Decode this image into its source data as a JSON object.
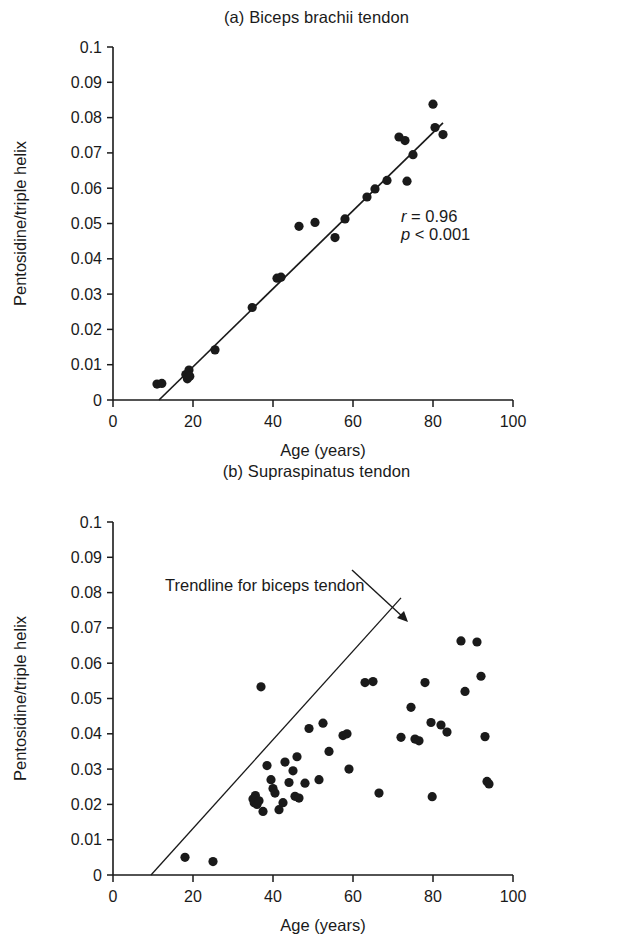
{
  "figure": {
    "x_axis_title": "Age (years)",
    "y_axis_title": "Pentosidine/triple helix"
  },
  "chart_data": [
    {
      "type": "scatter",
      "panel": "a",
      "title": "(a)  Biceps brachii tendon",
      "xlabel": "Age (years)",
      "ylabel": "Pentosidine/triple helix",
      "xlim": [
        0,
        100
      ],
      "ylim": [
        0,
        0.1
      ],
      "xticks": [
        0,
        20,
        40,
        60,
        80,
        100
      ],
      "xtick_labels": [
        "0",
        "20",
        "40",
        "60",
        "80",
        "100"
      ],
      "yticks": [
        0,
        0.01,
        0.02,
        0.03,
        0.04,
        0.05,
        0.06,
        0.07,
        0.08,
        0.09,
        0.1
      ],
      "ytick_labels": [
        "0",
        "0.01",
        "0.02",
        "0.03",
        "0.04",
        "0.05",
        "0.06",
        "0.07",
        "0.08",
        "0.09",
        "0.1"
      ],
      "grid": false,
      "legend": "none",
      "annotations": [
        {
          "text_italic": "r",
          "text_rest": " = 0.96",
          "x": 72,
          "y": 0.0505
        },
        {
          "text_italic": "p",
          "text_rest": " < 0.001",
          "x": 72,
          "y": 0.0452
        }
      ],
      "trendline": {
        "x": [
          11.5,
          82.5
        ],
        "y": [
          0.0,
          0.0785
        ]
      },
      "points": [
        {
          "x": 11.0,
          "y": 0.0045
        },
        {
          "x": 12.2,
          "y": 0.0047
        },
        {
          "x": 18.2,
          "y": 0.0072
        },
        {
          "x": 18.6,
          "y": 0.006
        },
        {
          "x": 19.0,
          "y": 0.0085
        },
        {
          "x": 19.2,
          "y": 0.0067
        },
        {
          "x": 25.5,
          "y": 0.0142
        },
        {
          "x": 34.8,
          "y": 0.0262
        },
        {
          "x": 41.0,
          "y": 0.0345
        },
        {
          "x": 42.0,
          "y": 0.0348
        },
        {
          "x": 46.5,
          "y": 0.0492
        },
        {
          "x": 50.5,
          "y": 0.0503
        },
        {
          "x": 55.5,
          "y": 0.046
        },
        {
          "x": 58.0,
          "y": 0.0513
        },
        {
          "x": 63.5,
          "y": 0.0575
        },
        {
          "x": 65.5,
          "y": 0.0598
        },
        {
          "x": 68.5,
          "y": 0.0622
        },
        {
          "x": 71.5,
          "y": 0.0745
        },
        {
          "x": 73.0,
          "y": 0.0735
        },
        {
          "x": 73.5,
          "y": 0.062
        },
        {
          "x": 75.0,
          "y": 0.0695
        },
        {
          "x": 80.0,
          "y": 0.0838
        },
        {
          "x": 80.5,
          "y": 0.0772
        },
        {
          "x": 82.5,
          "y": 0.0752
        }
      ]
    },
    {
      "type": "scatter",
      "panel": "b",
      "title": "(b)  Supraspinatus tendon",
      "xlabel": "Age (years)",
      "ylabel": "Pentosidine/triple helix",
      "xlim": [
        0,
        100
      ],
      "ylim": [
        0,
        0.1
      ],
      "xticks": [
        0,
        20,
        40,
        60,
        80,
        100
      ],
      "xtick_labels": [
        "0",
        "20",
        "40",
        "60",
        "80",
        "100"
      ],
      "yticks": [
        0,
        0.01,
        0.02,
        0.03,
        0.04,
        0.05,
        0.06,
        0.07,
        0.08,
        0.09,
        0.1
      ],
      "ytick_labels": [
        "0",
        "0.01",
        "0.02",
        "0.03",
        "0.04",
        "0.05",
        "0.06",
        "0.07",
        "0.08",
        "0.09",
        "0.1"
      ],
      "grid": false,
      "legend": "none",
      "annotations": [
        {
          "text": "Trendline for biceps tendon",
          "x": 13,
          "y": 0.0805
        }
      ],
      "trendline": {
        "x": [
          9.5,
          72.0
        ],
        "y": [
          0.0,
          0.0785
        ],
        "label": "Trendline for biceps tendon"
      },
      "points": [
        {
          "x": 18.0,
          "y": 0.005
        },
        {
          "x": 25.0,
          "y": 0.0038
        },
        {
          "x": 35.0,
          "y": 0.0215
        },
        {
          "x": 35.3,
          "y": 0.0205
        },
        {
          "x": 35.6,
          "y": 0.0225
        },
        {
          "x": 36.0,
          "y": 0.02
        },
        {
          "x": 36.5,
          "y": 0.021
        },
        {
          "x": 37.0,
          "y": 0.0533
        },
        {
          "x": 37.5,
          "y": 0.018
        },
        {
          "x": 38.5,
          "y": 0.031
        },
        {
          "x": 39.5,
          "y": 0.027
        },
        {
          "x": 40.0,
          "y": 0.0245
        },
        {
          "x": 40.5,
          "y": 0.0232
        },
        {
          "x": 41.5,
          "y": 0.0185
        },
        {
          "x": 42.5,
          "y": 0.0205
        },
        {
          "x": 43.0,
          "y": 0.032
        },
        {
          "x": 44.0,
          "y": 0.0262
        },
        {
          "x": 45.0,
          "y": 0.0295
        },
        {
          "x": 45.5,
          "y": 0.0223
        },
        {
          "x": 46.0,
          "y": 0.0335
        },
        {
          "x": 46.5,
          "y": 0.0218
        },
        {
          "x": 48.0,
          "y": 0.026
        },
        {
          "x": 49.0,
          "y": 0.0415
        },
        {
          "x": 51.5,
          "y": 0.027
        },
        {
          "x": 52.5,
          "y": 0.043
        },
        {
          "x": 54.0,
          "y": 0.035
        },
        {
          "x": 57.5,
          "y": 0.0395
        },
        {
          "x": 58.5,
          "y": 0.04
        },
        {
          "x": 59.0,
          "y": 0.03
        },
        {
          "x": 63.0,
          "y": 0.0545
        },
        {
          "x": 65.0,
          "y": 0.0548
        },
        {
          "x": 66.5,
          "y": 0.0232
        },
        {
          "x": 72.0,
          "y": 0.039
        },
        {
          "x": 74.5,
          "y": 0.0475
        },
        {
          "x": 75.5,
          "y": 0.0385
        },
        {
          "x": 76.5,
          "y": 0.038
        },
        {
          "x": 78.0,
          "y": 0.0545
        },
        {
          "x": 79.5,
          "y": 0.0432
        },
        {
          "x": 79.8,
          "y": 0.0222
        },
        {
          "x": 82.0,
          "y": 0.0425
        },
        {
          "x": 83.5,
          "y": 0.0405
        },
        {
          "x": 87.0,
          "y": 0.0663
        },
        {
          "x": 88.0,
          "y": 0.052
        },
        {
          "x": 91.0,
          "y": 0.066
        },
        {
          "x": 92.0,
          "y": 0.0563
        },
        {
          "x": 93.0,
          "y": 0.0392
        },
        {
          "x": 93.5,
          "y": 0.0265
        },
        {
          "x": 94.0,
          "y": 0.0258
        }
      ]
    }
  ]
}
